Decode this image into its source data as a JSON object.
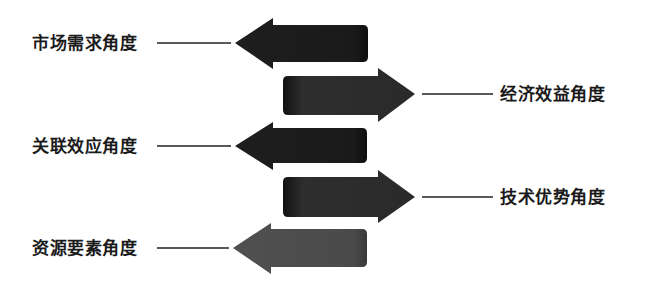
{
  "diagram": {
    "title": "",
    "items": [
      {
        "label": "市场需求角度",
        "direction": "left",
        "side": "left",
        "color": "#1c1c1c"
      },
      {
        "label": "经济效益角度",
        "direction": "right",
        "side": "right",
        "color": "#2b2b2b"
      },
      {
        "label": "关联效应角度",
        "direction": "left",
        "side": "left",
        "color": "#1c1c1c"
      },
      {
        "label": "技术优势角度",
        "direction": "right",
        "side": "right",
        "color": "#2b2b2b"
      },
      {
        "label": "资源要素角度",
        "direction": "left",
        "side": "left",
        "color": "#4a4a4a"
      }
    ]
  }
}
